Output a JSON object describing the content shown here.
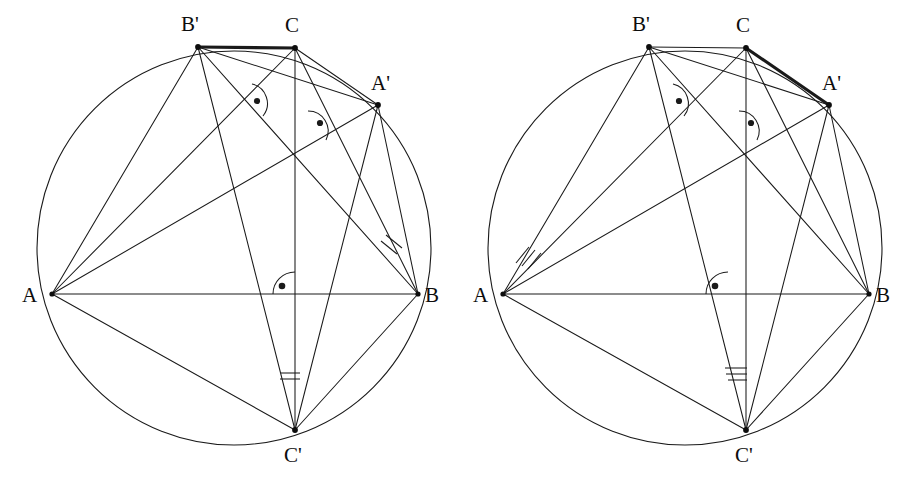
{
  "figure": {
    "panel_count": 2,
    "stroke_color": "#1a1a1a",
    "background_color": "#ffffff"
  },
  "geometry": {
    "circle": {
      "cx": 234,
      "cy": 248,
      "r": 197
    },
    "points": {
      "A": {
        "x": 52,
        "y": 294,
        "label": "A",
        "label_x": 22,
        "label_y": 302
      },
      "B": {
        "x": 418,
        "y": 294,
        "label": "B",
        "label_x": 425,
        "label_y": 302
      },
      "C": {
        "x": 295,
        "y": 48,
        "label": "C",
        "label_x": 283,
        "label_y": 32
      },
      "Ap": {
        "x": 378,
        "y": 105,
        "label": "A'",
        "label_x": 372,
        "label_y": 89
      },
      "Bp": {
        "x": 198,
        "y": 47,
        "label": "B'",
        "label_x": 180,
        "label_y": 31
      },
      "Cp": {
        "x": 295,
        "y": 430,
        "label": "C'",
        "label_x": 283,
        "label_y": 461
      },
      "H": {
        "x": 295,
        "y": 160,
        "label": "H",
        "label_x": 295,
        "label_y": 160
      },
      "F": {
        "x": 295,
        "y": 294,
        "label": "F",
        "label_x": 295,
        "label_y": 294
      }
    }
  },
  "panels": [
    {
      "id": "left-panel",
      "name": "left-figure",
      "highlight_segment": "B'C",
      "highlight_from": "Bp",
      "highlight_to": "C",
      "angle_mark_count": 2,
      "angle_marks": [
        {
          "at": "B",
          "kind": "tick",
          "count": 2
        },
        {
          "at": "Cp",
          "kind": "arc",
          "count": 2
        }
      ],
      "right_angle_marks": [
        {
          "at": "foot-on-CB'",
          "kind": "right-angle"
        },
        {
          "at": "foot-on-CA'",
          "kind": "right-angle"
        },
        {
          "at": "foot-on-AB",
          "kind": "right-angle"
        }
      ],
      "labels": [
        "A",
        "B",
        "C",
        "A'",
        "B'",
        "C'"
      ]
    },
    {
      "id": "right-panel",
      "name": "right-figure",
      "highlight_segment": "CA'",
      "highlight_from": "C",
      "highlight_to": "Ap",
      "angle_mark_count": 3,
      "angle_marks": [
        {
          "at": "A",
          "kind": "tick",
          "count": 3
        },
        {
          "at": "Cp",
          "kind": "arc",
          "count": 3
        }
      ],
      "right_angle_marks": [
        {
          "at": "foot-on-CB'",
          "kind": "right-angle"
        },
        {
          "at": "foot-on-CA'",
          "kind": "right-angle"
        },
        {
          "at": "foot-on-AB",
          "kind": "right-angle"
        }
      ],
      "labels": [
        "A",
        "B",
        "C",
        "A'",
        "B'",
        "C'"
      ]
    }
  ],
  "edges": [
    {
      "from": "A",
      "to": "B",
      "name": "segment-AB"
    },
    {
      "from": "A",
      "to": "C",
      "name": "segment-AC"
    },
    {
      "from": "B",
      "to": "C",
      "name": "segment-BC"
    },
    {
      "from": "A",
      "to": "Ap",
      "name": "segment-A-Aprime"
    },
    {
      "from": "A",
      "to": "Bp",
      "name": "segment-A-Bprime"
    },
    {
      "from": "B",
      "to": "Bp",
      "name": "segment-B-Bprime"
    },
    {
      "from": "B",
      "to": "Ap",
      "name": "segment-B-Aprime"
    },
    {
      "from": "C",
      "to": "Cp",
      "name": "segment-C-Cprime"
    },
    {
      "from": "A",
      "to": "Cp",
      "name": "segment-A-Cprime"
    },
    {
      "from": "B",
      "to": "Cp",
      "name": "segment-B-Cprime"
    },
    {
      "from": "Bp",
      "to": "Cp",
      "name": "segment-Bprime-Cprime"
    },
    {
      "from": "Ap",
      "to": "Cp",
      "name": "segment-Aprime-Cprime"
    },
    {
      "from": "Bp",
      "to": "Ap",
      "name": "segment-Bprime-Aprime"
    },
    {
      "from": "Bp",
      "to": "C",
      "name": "segment-Bprime-C"
    },
    {
      "from": "C",
      "to": "Ap",
      "name": "segment-C-Aprime"
    }
  ],
  "labels": {
    "A": "A",
    "B": "B",
    "C": "C",
    "Aprime": "A'",
    "Bprime": "B'",
    "Cprime": "C'"
  }
}
